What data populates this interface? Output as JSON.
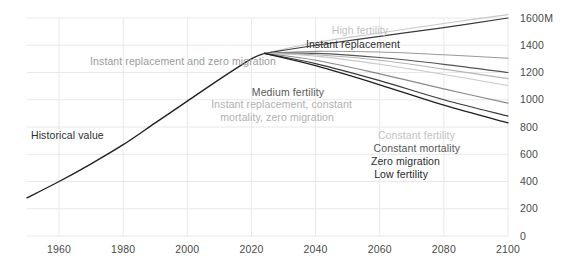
{
  "chart_data": {
    "type": "line",
    "title": "",
    "subtitle": "",
    "xlabel": "",
    "ylabel": "",
    "unit_suffix": "M",
    "xlim": [
      1950,
      2100
    ],
    "ylim": [
      0,
      1600
    ],
    "xticks": [
      1960,
      1980,
      2000,
      2020,
      2040,
      2060,
      2080,
      2100
    ],
    "xtick_labels": [
      "1960",
      "1980",
      "2000",
      "2020",
      "2040",
      "2060",
      "2080",
      "2100"
    ],
    "yticks": [
      0,
      200,
      400,
      600,
      800,
      1000,
      1200,
      1400,
      1600
    ],
    "ytick_labels": [
      "0",
      "200",
      "400",
      "600",
      "800",
      "1000",
      "1200",
      "1400",
      "1600M"
    ],
    "grid": true,
    "grid_color": "#e8e8e8",
    "legend_position": "inline-annotations",
    "split_year": 2024,
    "series": [
      {
        "name": "Historical value",
        "color": "#222222",
        "width": 1.4,
        "x": [
          1950,
          1960,
          1970,
          1980,
          1990,
          2000,
          2010,
          2020,
          2024
        ],
        "values": [
          280,
          400,
          530,
          670,
          830,
          990,
          1150,
          1300,
          1340
        ]
      },
      {
        "name": "High fertility",
        "color": "#c9c9c9",
        "width": 1.1,
        "x": [
          2024,
          2040,
          2060,
          2080,
          2100
        ],
        "values": [
          1340,
          1420,
          1490,
          1560,
          1625
        ]
      },
      {
        "name": "Instant replacement",
        "color": "#3a3a3a",
        "width": 1.2,
        "x": [
          2024,
          2040,
          2060,
          2080,
          2100
        ],
        "values": [
          1340,
          1400,
          1465,
          1530,
          1600
        ]
      },
      {
        "name": "Instant replacement and zero migration",
        "color": "#9a9a9a",
        "width": 1.1,
        "x": [
          2024,
          2040,
          2060,
          2080,
          2100
        ],
        "values": [
          1340,
          1355,
          1350,
          1330,
          1305
        ]
      },
      {
        "name": "Medium fertility",
        "color": "#555555",
        "width": 1.2,
        "x": [
          2024,
          2040,
          2060,
          2080,
          2100
        ],
        "values": [
          1340,
          1340,
          1310,
          1260,
          1200
        ]
      },
      {
        "name": "Instant replacement, constant mortality, zero migration",
        "color": "#b5b5b5",
        "width": 1.1,
        "x": [
          2024,
          2040,
          2060,
          2080,
          2100
        ],
        "values": [
          1340,
          1330,
          1290,
          1225,
          1155
        ]
      },
      {
        "name": "Constant fertility",
        "color": "#c9c9c9",
        "width": 1.1,
        "x": [
          2024,
          2040,
          2060,
          2080,
          2100
        ],
        "values": [
          1340,
          1320,
          1260,
          1185,
          1105
        ]
      },
      {
        "name": "Constant mortality",
        "color": "#8a8a8a",
        "width": 1.1,
        "x": [
          2024,
          2040,
          2060,
          2080,
          2100
        ],
        "values": [
          1340,
          1290,
          1190,
          1080,
          975
        ]
      },
      {
        "name": "Zero migration",
        "color": "#3a3a3a",
        "width": 1.2,
        "x": [
          2024,
          2040,
          2060,
          2080,
          2100
        ],
        "values": [
          1340,
          1265,
          1140,
          1000,
          880
        ]
      },
      {
        "name": "Low fertility",
        "color": "#1f1f1f",
        "width": 1.3,
        "x": [
          2024,
          2040,
          2060,
          2080,
          2100
        ],
        "values": [
          1340,
          1250,
          1110,
          960,
          830
        ]
      }
    ],
    "annotations": [
      {
        "id": "high-fertility",
        "text": "High fertility",
        "color": "#c2c2c2",
        "x": 388,
        "y": 34,
        "anchor": "end"
      },
      {
        "id": "instant-replacement",
        "text": "Instant replacement",
        "color": "#2e2e2e",
        "x": 400,
        "y": 48,
        "anchor": "end"
      },
      {
        "id": "instant-repl-zero-mig",
        "text": "Instant replacement and zero migration",
        "color": "#9b9b9b",
        "x": 276,
        "y": 65,
        "anchor": "end"
      },
      {
        "id": "medium-fertility",
        "text": "Medium fertility",
        "color": "#5a5a5a",
        "x": 324,
        "y": 96,
        "anchor": "end"
      },
      {
        "id": "instant-repl-const-1",
        "text": "Instant replacement, constant",
        "color": "#b0b0b0",
        "x": 352,
        "y": 108,
        "anchor": "end"
      },
      {
        "id": "instant-repl-const-2",
        "text": "mortality, zero migration",
        "color": "#b0b0b0",
        "x": 334,
        "y": 121,
        "anchor": "end"
      },
      {
        "id": "constant-fertility",
        "text": "Constant fertility",
        "color": "#c2c2c2",
        "x": 455,
        "y": 139,
        "anchor": "end"
      },
      {
        "id": "constant-mortality",
        "text": "Constant mortality",
        "color": "#555555",
        "x": 460,
        "y": 152,
        "anchor": "end"
      },
      {
        "id": "zero-migration",
        "text": "Zero migration",
        "color": "#2e2e2e",
        "x": 440,
        "y": 165,
        "anchor": "end"
      },
      {
        "id": "low-fertility",
        "text": "Low fertility",
        "color": "#1f1f1f",
        "x": 428,
        "y": 178,
        "anchor": "end"
      },
      {
        "id": "historical-value",
        "text": "Historical value",
        "color": "#2e2e2e",
        "x": 31,
        "y": 139,
        "anchor": "start"
      }
    ]
  }
}
